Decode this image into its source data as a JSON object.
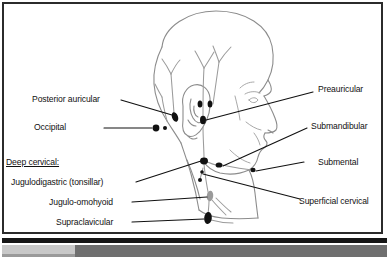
{
  "figure": {
    "frame_color": "#2b2b2b",
    "line_color": "#8c8c8c",
    "node_color": "#111111",
    "leader_color": "#111111",
    "background": "#ffffff"
  },
  "labels": {
    "posterior_auricular": "Posterior auricular",
    "occipital": "Occipital",
    "deep_cervical_heading": "Deep cervical:",
    "jugulodigastric": "Jugulodigastric (tonsillar)",
    "jugulo_omohyoid": "Jugulo-omohyoid",
    "supraclavicular": "Supraclavicular",
    "preauricular": "Preauricular",
    "submandibular": "Submandibular",
    "submental": "Submental",
    "superficial_cervical": "Superficial cervical"
  },
  "nodes": [
    {
      "name": "posterior-auricular-node",
      "cx": 175,
      "cy": 117,
      "rx": 3.0,
      "ry": 5.0,
      "rot": -20,
      "fill": "#111111"
    },
    {
      "name": "occipital-node-lateral",
      "cx": 156,
      "cy": 128,
      "rx": 3.4,
      "ry": 3.4,
      "rot": 0,
      "fill": "#111111"
    },
    {
      "name": "occipital-node-medial",
      "cx": 165,
      "cy": 128,
      "rx": 2.0,
      "ry": 2.0,
      "rot": 0,
      "fill": "#111111"
    },
    {
      "name": "preauricular-node-upper-left",
      "cx": 200,
      "cy": 104,
      "rx": 2.4,
      "ry": 3.6,
      "rot": 0,
      "fill": "#111111"
    },
    {
      "name": "preauricular-node-upper-right",
      "cx": 210,
      "cy": 104,
      "rx": 2.4,
      "ry": 3.6,
      "rot": 0,
      "fill": "#111111"
    },
    {
      "name": "preauricular-node-lower",
      "cx": 203,
      "cy": 120,
      "rx": 3.0,
      "ry": 4.2,
      "rot": 0,
      "fill": "#111111"
    },
    {
      "name": "deep-cervical-junction-node",
      "cx": 204,
      "cy": 161,
      "rx": 4.0,
      "ry": 3.4,
      "rot": 0,
      "fill": "#111111"
    },
    {
      "name": "submandibular-node",
      "cx": 219,
      "cy": 165,
      "rx": 3.4,
      "ry": 2.6,
      "rot": 0,
      "fill": "#111111"
    },
    {
      "name": "submental-node",
      "cx": 253,
      "cy": 170,
      "rx": 2.6,
      "ry": 2.2,
      "rot": 0,
      "fill": "#111111"
    },
    {
      "name": "superficial-cervical-node-upper",
      "cx": 202,
      "cy": 172,
      "rx": 1.8,
      "ry": 1.8,
      "rot": 0,
      "fill": "#111111"
    },
    {
      "name": "superficial-cervical-node-lower",
      "cx": 200,
      "cy": 180,
      "rx": 2.0,
      "ry": 2.0,
      "rot": 0,
      "fill": "#111111"
    },
    {
      "name": "jugulo-omohyoid-node",
      "cx": 210,
      "cy": 196,
      "rx": 3.2,
      "ry": 5.2,
      "rot": 8,
      "fill": "#9a9a9a"
    },
    {
      "name": "supraclavicular-node",
      "cx": 208,
      "cy": 218,
      "rx": 3.8,
      "ry": 6.0,
      "rot": 6,
      "fill": "#111111"
    }
  ],
  "leaders": [
    {
      "name": "leader-posterior-auricular",
      "points": "121,100 172,115"
    },
    {
      "name": "leader-occipital",
      "points": "104,128 152,128"
    },
    {
      "name": "leader-preauricular",
      "points": "313,92 206,120"
    },
    {
      "name": "leader-submandibular",
      "points": "307,128 223,166"
    },
    {
      "name": "leader-submental",
      "points": "304,162 256,171"
    },
    {
      "name": "leader-superficial-cervical",
      "points": "300,199 203,174"
    },
    {
      "name": "leader-jugulodigastric",
      "points": "136,182 201,161"
    },
    {
      "name": "leader-jugulo-omohyoid",
      "points": "132,202 207,197"
    },
    {
      "name": "leader-supraclavicular",
      "points": "132,222 204,219"
    }
  ],
  "bottom_bar": {
    "name": "bottom-scrollbar",
    "black_strip_color": "#161616",
    "track_color": "#6f6f6f",
    "thumb_color": "#c8c8c8"
  }
}
